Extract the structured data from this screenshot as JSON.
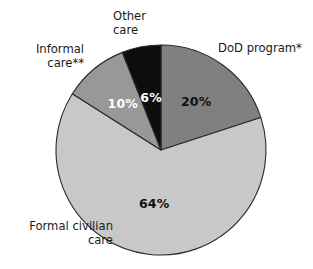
{
  "chart_data": {
    "type": "pie",
    "title": "",
    "subtitle": "",
    "xlabel": "",
    "ylabel": "",
    "legend_position": "none",
    "grid": false,
    "units": "percent",
    "start_angle_deg": 0,
    "direction": "clockwise",
    "categories": [
      "DoD program*",
      "Formal civilian care",
      "Informal care**",
      "Other care"
    ],
    "values": [
      20,
      64,
      10,
      6
    ],
    "value_labels": [
      "20%",
      "64%",
      "10%",
      "6%"
    ],
    "colors": [
      "#808080",
      "#c8c8c8",
      "#989898",
      "#0d0d0d"
    ],
    "label_text_colors": [
      "#111111",
      "#111111",
      "#ffffff",
      "#ffffff"
    ],
    "slices": [
      {
        "name": "DoD program*",
        "value": 20,
        "value_label": "20%",
        "color": "#808080",
        "label_color": "#111111",
        "callout": "DoD program*"
      },
      {
        "name": "Formal civilian care",
        "value": 64,
        "value_label": "64%",
        "color": "#c8c8c8",
        "label_color": "#111111",
        "callout": "Formal civilian\ncare"
      },
      {
        "name": "Informal care**",
        "value": 10,
        "value_label": "10%",
        "color": "#989898",
        "label_color": "#ffffff",
        "callout": "Informal\ncare**"
      },
      {
        "name": "Other care",
        "value": 6,
        "value_label": "6%",
        "color": "#0d0d0d",
        "label_color": "#ffffff",
        "callout": "Other\ncare"
      }
    ]
  },
  "labels": {
    "other_care": "Other\ncare",
    "dod_program": "DoD program*",
    "informal_care": "Informal\ncare**",
    "formal_civilian_care": "Formal civilian\ncare"
  },
  "values": {
    "dod_program": "20%",
    "formal_civilian_care": "64%",
    "informal_care": "10%",
    "other_care": "6%"
  },
  "colors": {
    "background": "#ffffff",
    "outline": "#2b2b2b",
    "dod_program": "#808080",
    "formal_civilian_care": "#c8c8c8",
    "informal_care": "#989898",
    "other_care": "#0d0d0d"
  }
}
